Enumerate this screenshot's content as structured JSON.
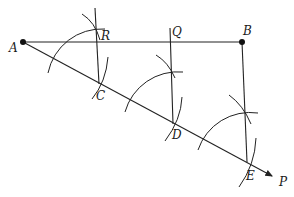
{
  "diagram": {
    "type": "geometric-construction",
    "points": {
      "A": {
        "label": "A",
        "x": 23,
        "y": 42
      },
      "B": {
        "label": "B",
        "x": 242,
        "y": 42
      },
      "C": {
        "label": "C",
        "x": 99,
        "y": 82
      },
      "D": {
        "label": "D",
        "x": 173,
        "y": 122
      },
      "E": {
        "label": "E",
        "x": 247,
        "y": 162
      },
      "P": {
        "label": "P",
        "x": 275,
        "y": 177
      },
      "R": {
        "label": "R",
        "x": 97,
        "y": 42
      },
      "Q": {
        "label": "Q",
        "x": 171,
        "y": 42
      }
    },
    "labels": {
      "A": "A",
      "B": "B",
      "C": "C",
      "D": "D",
      "E": "E",
      "P": "P",
      "R": "R",
      "Q": "Q"
    },
    "segments": [
      "AB",
      "AP (ray)",
      "BE",
      "CR",
      "DQ"
    ],
    "colors": {
      "stroke": "#222222",
      "background": "#ffffff"
    }
  }
}
